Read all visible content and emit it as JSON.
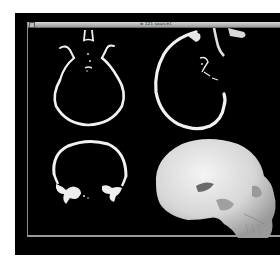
{
  "window": {
    "title": "w 121 source1"
  },
  "viewer": {
    "panels": [
      {
        "id": "axial",
        "label": "Axial CT slice",
        "view": "2D"
      },
      {
        "id": "sagittal",
        "label": "Sagittal CT slice",
        "view": "2D"
      },
      {
        "id": "coronal",
        "label": "Coronal CT slice",
        "view": "2D"
      },
      {
        "id": "volume",
        "label": "3D skull surface rendering",
        "view": "3D"
      }
    ]
  },
  "colors": {
    "background": "#000000",
    "bone": "#f2f2f2",
    "titlebar": "#b5b5b5",
    "page": "#ffffff"
  }
}
